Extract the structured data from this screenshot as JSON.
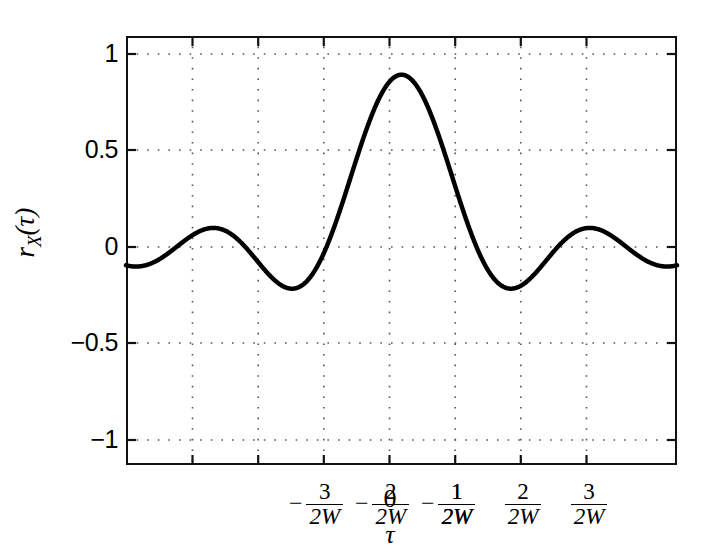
{
  "chart_data": {
    "type": "line",
    "title": "",
    "subtitle": "",
    "xlabel": "τ",
    "ylabel": "r_X(τ)",
    "ylabel_base": "r",
    "ylabel_sub": "X",
    "ylabel_arg": "(τ)",
    "xlim": [
      -3.6,
      3.6
    ],
    "ylim": [
      -1.22,
      1.22
    ],
    "grid": true,
    "grid_style": "dotted",
    "legend": "none",
    "xticks": [
      -3,
      -2,
      -1,
      0,
      1,
      2,
      3
    ],
    "xticklabels": [
      {
        "sign": "−",
        "num": "3",
        "den": "2W"
      },
      {
        "sign": "−",
        "num": "2",
        "den": "2W"
      },
      {
        "sign": "−",
        "num": "1",
        "den": "2W"
      },
      {
        "sign": "",
        "num": "0",
        "den": ""
      },
      {
        "sign": "",
        "num": "1",
        "den": "2W"
      },
      {
        "sign": "",
        "num": "2",
        "den": "2W"
      },
      {
        "sign": "",
        "num": "3",
        "den": "2W"
      }
    ],
    "yticks": [
      1,
      0.5,
      0,
      -0.5,
      -1
    ],
    "yticklabels": [
      "1",
      "0.5",
      "0",
      "−0.5",
      "−1"
    ],
    "series": [
      {
        "name": "r_X(tau) = sinc(2W tau)",
        "function": "sin(pi*x)/(pi*x)",
        "color": "#000000",
        "linewidth": 4.5,
        "x": [
          -3.6,
          -3.5,
          -3.4,
          -3.3,
          -3.2,
          -3.1,
          -3.0,
          -2.9,
          -2.8,
          -2.7,
          -2.6,
          -2.5,
          -2.4,
          -2.3,
          -2.2,
          -2.1,
          -2.0,
          -1.9,
          -1.8,
          -1.7,
          -1.6,
          -1.5,
          -1.4,
          -1.3,
          -1.2,
          -1.1,
          -1.0,
          -0.9,
          -0.8,
          -0.7,
          -0.6,
          -0.5,
          -0.4,
          -0.3,
          -0.2,
          -0.1,
          0.0,
          0.1,
          0.2,
          0.3,
          0.4,
          0.5,
          0.6,
          0.7,
          0.8,
          0.9,
          1.0,
          1.1,
          1.2,
          1.3,
          1.4,
          1.5,
          1.6,
          1.7,
          1.8,
          1.9,
          2.0,
          2.1,
          2.2,
          2.3,
          2.4,
          2.5,
          2.6,
          2.7,
          2.8,
          2.9,
          3.0,
          3.1,
          3.2,
          3.3,
          3.4,
          3.5,
          3.6
        ],
        "y": [
          -0.0736,
          -0.0909,
          -0.0876,
          -0.0646,
          -0.026,
          0.0207,
          0.0,
          -0.0341,
          -0.0668,
          -0.0899,
          -0.0968,
          -0.0847,
          -0.0552,
          -0.0138,
          0.0312,
          -0.0468,
          0.0,
          0.0496,
          0.0984,
          0.134,
          0.146,
          0.1273,
          0.0772,
          0.0019,
          -0.0898,
          -0.0894,
          0.0,
          -0.1093,
          -0.2339,
          -0.3678,
          -0.5046,
          -0.6366,
          -0.7568,
          -0.8584,
          -0.9355,
          -0.9836,
          1.0,
          0.9836,
          0.9355,
          0.8584,
          0.7568,
          0.6366,
          0.5046,
          0.3678,
          0.2339,
          0.1093,
          0.0,
          -0.0894,
          -0.1559,
          -0.1981,
          -0.2162,
          -0.2122,
          -0.1892,
          -0.1516,
          -0.1039,
          -0.0518,
          0.0,
          0.0448,
          0.0802,
          0.1033,
          0.1123,
          0.1061,
          0.0858,
          0.0541,
          0.0148,
          -0.0267,
          0.0,
          0.0207,
          -0.026,
          -0.0646,
          -0.0876,
          -0.0909,
          -0.0736
        ],
        "key_points": {
          "main_peak": {
            "x": 0,
            "y": 1.0
          },
          "zero_crossings": [
            -3,
            -2,
            -1,
            1,
            2,
            3
          ],
          "first_side_lobe_min": {
            "x": 1.43,
            "y": -0.217
          },
          "second_side_lobe_max": {
            "x": 2.46,
            "y": 0.128
          },
          "third_side_lobe_min": {
            "x": 3.47,
            "y": -0.091
          }
        }
      }
    ]
  },
  "figure": {
    "background_color": "#ffffff",
    "axis_color": "#111111",
    "grid_color": "#888888",
    "curve_color": "#000000"
  }
}
